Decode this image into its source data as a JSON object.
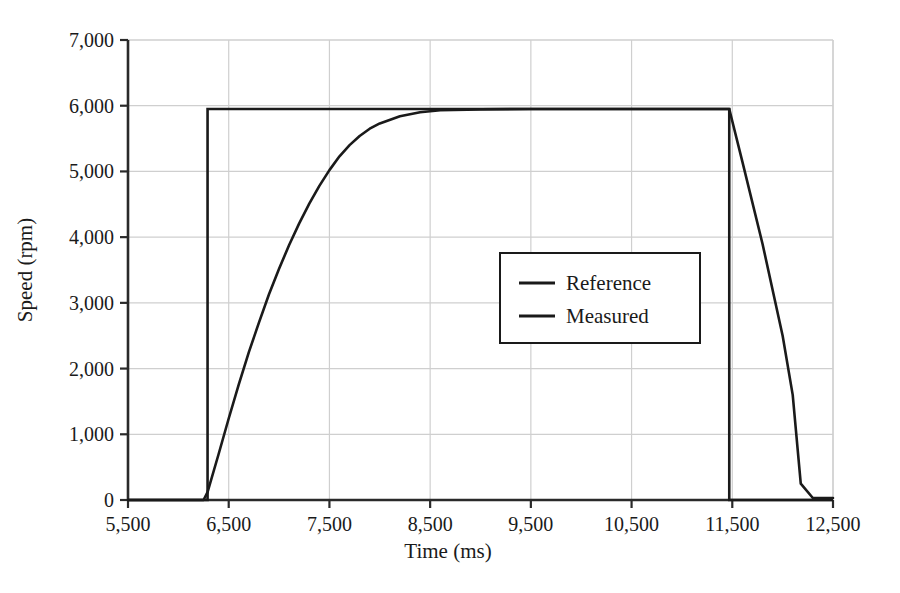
{
  "chart_data": {
    "type": "line",
    "title": "",
    "xlabel": "Time (ms)",
    "ylabel": "Speed (rpm)",
    "xlim": [
      5500,
      12500
    ],
    "ylim": [
      0,
      7000
    ],
    "xticks": [
      5500,
      6500,
      7500,
      8500,
      9500,
      10500,
      11500,
      12500
    ],
    "xtick_labels": [
      "5,500",
      "6,500",
      "7,500",
      "8,500",
      "9,500",
      "10,500",
      "11,500",
      "12,500"
    ],
    "yticks": [
      0,
      1000,
      2000,
      3000,
      4000,
      5000,
      6000,
      7000
    ],
    "ytick_labels": [
      "0",
      "1,000",
      "2,000",
      "3,000",
      "4,000",
      "5,000",
      "6,000",
      "7,000"
    ],
    "grid": true,
    "grid_color": "#cfcfcf",
    "line_color": "#1a1a1a",
    "legend_position": "center-right",
    "legend_entries": [
      "Reference",
      "Measured"
    ],
    "series": [
      {
        "name": "Reference",
        "x": [
          5500,
          6290,
          6290,
          11470,
          11470,
          12500
        ],
        "values": [
          0,
          0,
          5950,
          5950,
          0,
          0
        ]
      },
      {
        "name": "Measured",
        "x": [
          5500,
          6250,
          6290,
          6400,
          6500,
          6600,
          6700,
          6800,
          6900,
          7000,
          7100,
          7200,
          7300,
          7400,
          7500,
          7600,
          7700,
          7800,
          7900,
          8000,
          8200,
          8400,
          8600,
          9000,
          9500,
          10000,
          10500,
          11000,
          11470,
          11600,
          11800,
          12000,
          12100,
          12180,
          12300,
          12500
        ],
        "values": [
          0,
          0,
          120,
          700,
          1240,
          1760,
          2250,
          2700,
          3130,
          3520,
          3880,
          4210,
          4510,
          4780,
          5020,
          5230,
          5400,
          5540,
          5650,
          5730,
          5840,
          5900,
          5930,
          5945,
          5950,
          5950,
          5950,
          5950,
          5950,
          5150,
          3900,
          2500,
          1600,
          250,
          30,
          30
        ]
      }
    ]
  },
  "axes": {
    "x_title": "Time (ms)",
    "y_title": "Speed (rpm)"
  },
  "legend": {
    "items": [
      {
        "label": "Reference"
      },
      {
        "label": "Measured"
      }
    ]
  }
}
